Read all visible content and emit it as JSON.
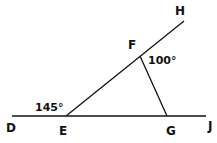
{
  "diagram": {
    "points": {
      "D": {
        "label": "D"
      },
      "E": {
        "label": "E"
      },
      "F": {
        "label": "F"
      },
      "G": {
        "label": "G"
      },
      "H": {
        "label": "H"
      },
      "J": {
        "label": "J"
      }
    },
    "angles": {
      "DEF": {
        "label": "145°"
      },
      "EFG_exterior": {
        "label": "100°"
      }
    },
    "segments": [
      "DJ",
      "EH",
      "FG"
    ],
    "line_color": "#111111"
  }
}
